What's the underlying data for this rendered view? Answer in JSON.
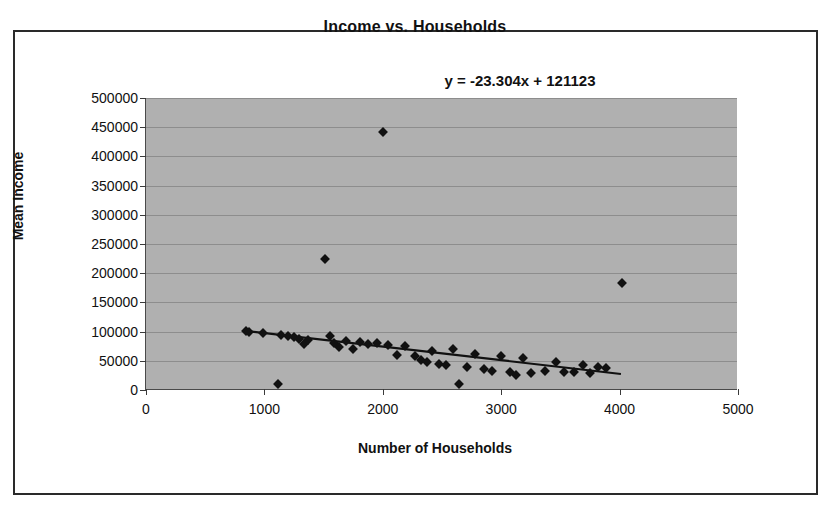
{
  "chart_data": {
    "type": "scatter",
    "title": "Income vs. Households",
    "xlabel": "Number of Households",
    "ylabel": "Mean Income",
    "annotation": "y = -23.304x + 121123",
    "xlim": [
      0,
      5000
    ],
    "ylim": [
      0,
      500000
    ],
    "xticks": [
      0,
      1000,
      2000,
      3000,
      4000,
      5000
    ],
    "xtick_labels": [
      "0",
      "1000",
      "2000",
      "3000",
      "4000",
      "5000"
    ],
    "yticks": [
      0,
      50000,
      100000,
      150000,
      200000,
      250000,
      300000,
      350000,
      400000,
      450000,
      500000
    ],
    "ytick_labels": [
      "0",
      "50000",
      "100000",
      "150000",
      "200000",
      "250000",
      "300000",
      "350000",
      "400000",
      "450000",
      "500000"
    ],
    "grid": "horizontal",
    "legend": "none",
    "plot_background": "#b0b0b0",
    "marker": "diamond",
    "marker_color": "#111111",
    "trendline": {
      "slope": -23.304,
      "intercept": 121123,
      "x_start": 830,
      "x_end": 4020,
      "color": "#111111"
    },
    "points": [
      [
        850,
        101000
      ],
      [
        880,
        99000
      ],
      [
        1000,
        97000
      ],
      [
        1120,
        10000
      ],
      [
        1150,
        95000
      ],
      [
        1210,
        92000
      ],
      [
        1260,
        90000
      ],
      [
        1300,
        88000
      ],
      [
        1340,
        78000
      ],
      [
        1380,
        86000
      ],
      [
        1520,
        225000
      ],
      [
        1560,
        93000
      ],
      [
        1600,
        80000
      ],
      [
        1640,
        74000
      ],
      [
        1700,
        84000
      ],
      [
        1760,
        71000
      ],
      [
        1820,
        82000
      ],
      [
        1880,
        78000
      ],
      [
        1960,
        80000
      ],
      [
        2010,
        441000
      ],
      [
        2050,
        77000
      ],
      [
        2130,
        60000
      ],
      [
        2200,
        75000
      ],
      [
        2280,
        58000
      ],
      [
        2330,
        52000
      ],
      [
        2380,
        48000
      ],
      [
        2420,
        66000
      ],
      [
        2480,
        45000
      ],
      [
        2540,
        43000
      ],
      [
        2600,
        70000
      ],
      [
        2650,
        11000
      ],
      [
        2720,
        40000
      ],
      [
        2790,
        62000
      ],
      [
        2860,
        36000
      ],
      [
        2930,
        33000
      ],
      [
        3010,
        58000
      ],
      [
        3080,
        31000
      ],
      [
        3130,
        26000
      ],
      [
        3190,
        54000
      ],
      [
        3260,
        29000
      ],
      [
        3380,
        33000
      ],
      [
        3470,
        48000
      ],
      [
        3540,
        31000
      ],
      [
        3620,
        30000
      ],
      [
        3700,
        43000
      ],
      [
        3760,
        29000
      ],
      [
        3830,
        40000
      ],
      [
        3890,
        38000
      ],
      [
        4030,
        183000
      ]
    ]
  }
}
